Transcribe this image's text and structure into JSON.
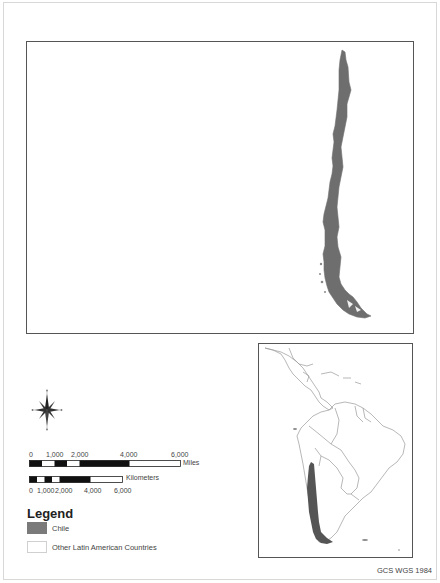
{
  "map": {
    "main_view": {
      "feature": "Chile",
      "fill_color": "#6e6e6e"
    },
    "inset_view": {
      "region": "Latin America",
      "highlight": "Chile",
      "highlight_color": "#555555",
      "outline_color": "#9a9a9a"
    }
  },
  "north_arrow": {
    "labels": {
      "n": "N",
      "s": "S",
      "e": "E",
      "w": "W"
    }
  },
  "scale_bar_miles": {
    "ticks": [
      "0",
      "1,000",
      "2,000",
      "4,000",
      "6,000"
    ],
    "unit": "Miles"
  },
  "scale_bar_km": {
    "ticks": [
      "0",
      "1,000",
      "2,000",
      "4,000",
      "6,000"
    ],
    "unit": "Kilometers"
  },
  "legend": {
    "title": "Legend",
    "items": [
      {
        "label": "Chile",
        "color": "#7a7a7a"
      },
      {
        "label": "Other Latin American Countries",
        "color": "#ffffff"
      }
    ]
  },
  "crs_label": "GCS WGS 1984"
}
